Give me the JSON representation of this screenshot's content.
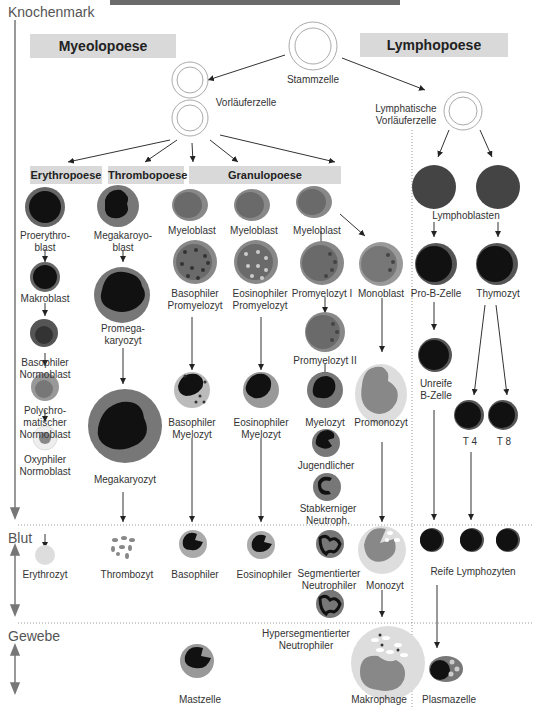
{
  "zones": {
    "bone_marrow": "Knochenmark",
    "blood": "Blut",
    "tissue": "Gewebe"
  },
  "sections": {
    "myelopoiesis": "Myeolopoese",
    "lymphopoiesis": "Lymphopoese",
    "erythropoiesis": "Erythropoese",
    "thrombopoiesis": "Thrombopoese",
    "granulopoiesis": "Granulopoese"
  },
  "cells": {
    "stem_cell": "Stammzelle",
    "progenitor": "Vorläuferzelle",
    "lymph_progenitor_1": "Lymphatische",
    "lymph_progenitor_2": "Vorläuferzelle",
    "proerythroblast_1": "Proerythro-",
    "proerythroblast_2": "blast",
    "macroblast": "Makroblast",
    "baso_normoblast_1": "Basophiler",
    "baso_normoblast_2": "Normoblast",
    "poly_normoblast_1": "Polychro-",
    "poly_normoblast_2": "matischer",
    "poly_normoblast_3": "Normoblast",
    "oxy_normoblast_1": "Oxyphiler",
    "oxy_normoblast_2": "Normoblast",
    "erythrocyte": "Erythrozyt",
    "megakaryoblast_1": "Megakaroyo-",
    "megakaryoblast_2": "blast",
    "promegakaryocyte_1": "Promega-",
    "promegakaryocyte_2": "karyozyt",
    "megakaryocyte": "Megakaryozyt",
    "thrombocyte": "Thrombozyt",
    "myeloblast": "Myeloblast",
    "baso_promyelocyte_1": "Basophiler",
    "baso_promyelocyte_2": "Promyelozyt",
    "eos_promyelocyte_1": "Eosinophiler",
    "eos_promyelocyte_2": "Promyelozyt",
    "promyelocyte_1": "Promyelozyt I",
    "promyelocyte_2": "Promyelozyt II",
    "monoblast": "Monoblast",
    "baso_myelocyte_1": "Basophiler",
    "baso_myelocyte_2": "Myelozyt",
    "eos_myelocyte_1": "Eosinophiler",
    "eos_myelocyte_2": "Myelozyt",
    "myelocyte": "Myelozyt",
    "promonocyte": "Promonozyt",
    "juvenile": "Jugendlicher",
    "band_1": "Stabkerniger",
    "band_2": "Neutroph.",
    "basophil": "Basophiler",
    "eosinophil": "Eosinophiler",
    "seg_neutro_1": "Segmentierter",
    "seg_neutro_2": "Neutrophiler",
    "monocyte": "Monozyt",
    "hyperseg_1": "Hypersegmentierter",
    "hyperseg_2": "Neutrophiler",
    "mast_cell": "Mastzelle",
    "macrophage": "Makrophage",
    "lymphoblasts": "Lymphoblasten",
    "pro_b": "Pro-B-Zelle",
    "thymocyte": "Thymozyt",
    "immature_b_1": "Unreife",
    "immature_b_2": "B-Zelle",
    "t4": "T 4",
    "t8": "T 8",
    "mature_lymph": "Reife Lymphozyten",
    "plasma_cell": "Plasmazelle"
  },
  "colors": {
    "cell_outer": "#8a8a8a",
    "nucleus": "#111111",
    "label_bg": "#d9d9d9",
    "light": "#d8d8d8"
  }
}
